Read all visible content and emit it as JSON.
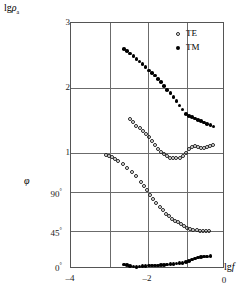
{
  "chart_data": {
    "type": "scatter",
    "title": "",
    "subtitle": "",
    "xlabel": "lg f",
    "ylabel_top": "lg ρa",
    "ylabel_bottom": "φ",
    "grid": true,
    "legend_position": "top-right",
    "xlim": [
      -4,
      0
    ],
    "xticks": [
      -4,
      -2,
      0
    ],
    "xtick_labels": [
      "–4",
      "–2",
      "0"
    ],
    "xgridlines": [
      -4,
      -3,
      -2,
      -1,
      0
    ],
    "panels": [
      {
        "name": "apparent-resistivity",
        "ylabel": "lg ρa",
        "ylim": [
          1,
          3
        ],
        "yticks": [
          1,
          2,
          3
        ],
        "ytick_labels": [
          "1",
          "2",
          "3"
        ]
      },
      {
        "name": "phase",
        "ylabel": "φ",
        "ylim": [
          0,
          135
        ],
        "yticks": [
          0,
          45,
          90
        ],
        "ytick_labels": [
          "0°",
          "45°",
          "90°"
        ]
      }
    ],
    "legend": [
      {
        "label": "TE",
        "marker": "open-circle"
      },
      {
        "label": "TM",
        "marker": "filled-circle"
      }
    ],
    "series": [
      {
        "name": "TM apparent resistivity",
        "panel": "apparent-resistivity",
        "marker": "filled-circle",
        "x": [
          -2.62,
          -2.54,
          -2.46,
          -2.38,
          -2.3,
          -2.22,
          -2.14,
          -2.06,
          -1.98,
          -1.9,
          -1.82,
          -1.74,
          -1.66,
          -1.58,
          -1.5,
          -1.42,
          -1.34,
          -1.26,
          -1.18,
          -1.1,
          -1.02,
          -0.94,
          -0.86,
          -0.78,
          -0.7,
          -0.62,
          -0.54,
          -0.46,
          -0.38,
          -0.3
        ],
        "y": [
          2.6,
          2.57,
          2.53,
          2.49,
          2.45,
          2.41,
          2.37,
          2.32,
          2.27,
          2.23,
          2.19,
          2.14,
          2.09,
          2.03,
          1.97,
          1.92,
          1.86,
          1.8,
          1.73,
          1.67,
          1.6,
          1.57,
          1.55,
          1.53,
          1.51,
          1.49,
          1.47,
          1.45,
          1.43,
          1.41
        ]
      },
      {
        "name": "TE apparent resistivity",
        "panel": "apparent-resistivity",
        "marker": "open-circle",
        "x": [
          -2.46,
          -2.38,
          -2.3,
          -2.22,
          -2.14,
          -2.06,
          -1.98,
          -1.9,
          -1.82,
          -1.74,
          -1.66,
          -1.58,
          -1.5,
          -1.42,
          -1.34,
          -1.26,
          -1.18,
          -1.1,
          -1.02,
          -0.94,
          -0.86,
          -0.78,
          -0.7,
          -0.62,
          -0.54,
          -0.46,
          -0.38,
          -0.3
        ],
        "y": [
          1.52,
          1.47,
          1.42,
          1.38,
          1.34,
          1.3,
          1.24,
          1.18,
          1.12,
          1.06,
          1.02,
          0.98,
          0.95,
          0.93,
          0.92,
          0.92,
          0.93,
          0.96,
          1.0,
          1.06,
          1.1,
          1.11,
          1.09,
          1.08,
          1.08,
          1.09,
          1.11,
          1.13
        ]
      },
      {
        "name": "TE phase",
        "panel": "phase",
        "marker": "open-circle",
        "x": [
          -3.1,
          -3.02,
          -2.94,
          -2.86,
          -2.78,
          -2.66,
          -2.54,
          -2.42,
          -2.3,
          -2.18,
          -2.1,
          -2.02,
          -1.94,
          -1.86,
          -1.78,
          -1.7,
          -1.62,
          -1.54,
          -1.46,
          -1.38,
          -1.3,
          -1.22,
          -1.14,
          -1.06,
          -0.98,
          -0.9,
          -0.82,
          -0.74,
          -0.66,
          -0.58,
          -0.5,
          -0.42
        ],
        "y": [
          133,
          132,
          130,
          128,
          126,
          122,
          118,
          113,
          108,
          102,
          97,
          92,
          87,
          82,
          77,
          73,
          69,
          65,
          62,
          59,
          57,
          55,
          53,
          51,
          49,
          47,
          46,
          46,
          45,
          45,
          45,
          45
        ]
      },
      {
        "name": "TM phase",
        "panel": "phase",
        "marker": "filled-circle",
        "x": [
          -2.62,
          -2.54,
          -2.46,
          -2.38,
          -2.3,
          -2.22,
          -2.14,
          -2.06,
          -1.98,
          -1.9,
          -1.82,
          -1.74,
          -1.66,
          -1.58,
          -1.5,
          -1.42,
          -1.34,
          -1.26,
          -1.18,
          -1.1,
          -1.02,
          -0.94,
          -0.86,
          -0.78,
          -0.7,
          -0.62,
          -0.54,
          -0.46,
          -0.38
        ],
        "y": [
          6.5,
          5.5,
          4.5,
          4.0,
          3.8,
          4.0,
          4.5,
          4.8,
          5.0,
          5.0,
          5.2,
          5.4,
          5.6,
          5.8,
          6.2,
          6.6,
          7.0,
          7.4,
          7.8,
          8.4,
          9.5,
          10.5,
          12.0,
          13.5,
          14.5,
          15.2,
          15.6,
          15.8,
          15.9
        ]
      }
    ]
  },
  "axes": {
    "y_top_label_prefix": "lg",
    "y_top_label_symbol": "ρ",
    "y_top_label_sub": "a",
    "y_bottom_label": "φ",
    "x_label_prefix": "lg",
    "x_label_symbol": "f",
    "yticks_top": [
      {
        "value": 3,
        "text": "3"
      },
      {
        "value": 2,
        "text": "2"
      },
      {
        "value": 1,
        "text": "1"
      }
    ],
    "yticks_bottom": [
      {
        "value": 90,
        "text": "90",
        "deg": "°"
      },
      {
        "value": 45,
        "text": "45",
        "deg": "°"
      },
      {
        "value": 0,
        "text": "0",
        "deg": "°"
      }
    ],
    "xticks": [
      {
        "value": -4,
        "text": "–4"
      },
      {
        "value": -2,
        "text": "–2"
      },
      {
        "value": 0,
        "text": "0"
      }
    ]
  },
  "legend": {
    "te": {
      "label": "TE",
      "marker": "open-circle"
    },
    "tm": {
      "label": "TM",
      "marker": "filled-circle"
    }
  },
  "colors": {
    "frame": "#555555",
    "grid": "#6b6b6b",
    "marker_fill": "#000000",
    "marker_open_stroke": "#222222",
    "background": "#ffffff"
  }
}
